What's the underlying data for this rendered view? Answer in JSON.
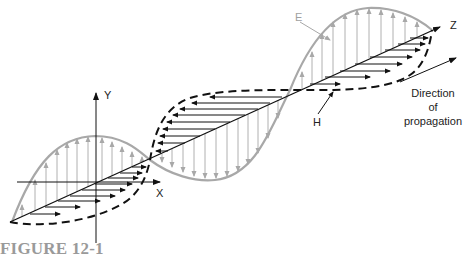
{
  "figure": {
    "caption": "FIGURE 12-1",
    "labels": {
      "y_axis": "Y",
      "x_axis": "X",
      "z_axis": "Z",
      "e_field": "E",
      "h_field": "H",
      "direction_line1": "Direction",
      "direction_line2": "of",
      "direction_line3": "propagation"
    },
    "colors": {
      "e_wave": "#a8a8a8",
      "h_wave": "#111111",
      "axes": "#111111",
      "caption": "#9a9a9a"
    }
  }
}
